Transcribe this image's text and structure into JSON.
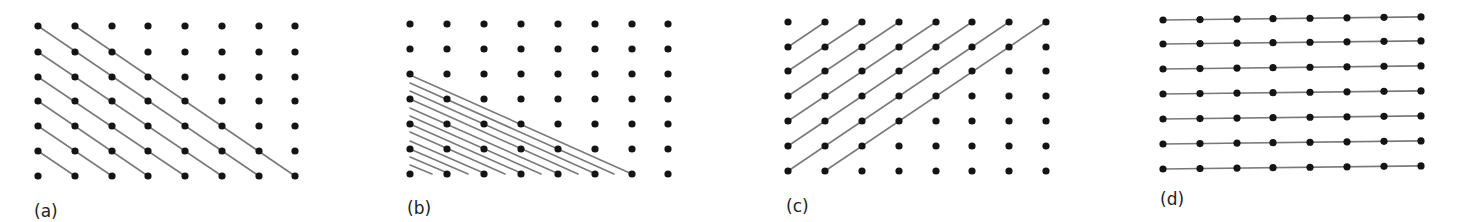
{
  "figure": {
    "colors": {
      "dot": "#141414",
      "line": "#7a7a7a",
      "label": "#222222",
      "background": "#ffffff"
    },
    "dot_radius": 3.6,
    "panels": [
      {
        "id": "a",
        "label": "(a)",
        "label_pos": [
          34,
          217
        ],
        "grid": {
          "cols": 8,
          "rows": 7,
          "x": [
            38,
            75,
            112,
            148,
            185,
            222,
            259,
            295
          ],
          "y": [
            26,
            52,
            77,
            101,
            126,
            151,
            176
          ]
        },
        "description": "Diagonal lines descending right, one column per row",
        "lines_grid": [
          [
            [
              1,
              0
            ],
            [
              7,
              6
            ]
          ],
          [
            [
              0,
              0
            ],
            [
              6,
              6
            ]
          ],
          [
            [
              0,
              1
            ],
            [
              5,
              6
            ]
          ],
          [
            [
              0,
              2
            ],
            [
              4,
              6
            ]
          ],
          [
            [
              0,
              3
            ],
            [
              3,
              6
            ]
          ],
          [
            [
              0,
              4
            ],
            [
              2,
              6
            ]
          ],
          [
            [
              0,
              5
            ],
            [
              1,
              6
            ]
          ]
        ]
      },
      {
        "id": "b",
        "label": "(b)",
        "label_pos": [
          407,
          214
        ],
        "grid": {
          "cols": 8,
          "rows": 7,
          "x": [
            410,
            447,
            484,
            521,
            558,
            595,
            632,
            668
          ],
          "y": [
            24,
            49,
            74,
            99,
            124,
            149,
            174
          ]
        },
        "description": "Dense family of shallow parallel lines in lower-left",
        "lines_px": [
          [
            [
              410,
              75
            ],
            [
              632,
              174
            ]
          ],
          [
            [
              410,
              83
            ],
            [
              614,
              174
            ]
          ],
          [
            [
              410,
              91
            ],
            [
              596,
              174
            ]
          ],
          [
            [
              410,
              99
            ],
            [
              578,
              174
            ]
          ],
          [
            [
              410,
              108
            ],
            [
              559,
              174
            ]
          ],
          [
            [
              410,
              116
            ],
            [
              541,
              174
            ]
          ],
          [
            [
              410,
              124
            ],
            [
              523,
              174
            ]
          ],
          [
            [
              410,
              132
            ],
            [
              505,
              174
            ]
          ],
          [
            [
              410,
              141
            ],
            [
              486,
              174
            ]
          ],
          [
            [
              410,
              149
            ],
            [
              468,
              174
            ]
          ],
          [
            [
              410,
              157
            ],
            [
              450,
              174
            ]
          ],
          [
            [
              410,
              165
            ],
            [
              432,
              174
            ]
          ]
        ]
      },
      {
        "id": "c",
        "label": "(c)",
        "label_pos": [
          786,
          212
        ],
        "grid": {
          "cols": 8,
          "rows": 7,
          "x": [
            788,
            825,
            862,
            899,
            936,
            972,
            1009,
            1046
          ],
          "y": [
            22,
            47,
            71,
            96,
            121,
            146,
            171
          ]
        },
        "description": "Diagonal lines ascending right, one column per row",
        "lines_grid": [
          [
            [
              0,
              1
            ],
            [
              1,
              0
            ]
          ],
          [
            [
              0,
              2
            ],
            [
              2,
              0
            ]
          ],
          [
            [
              0,
              3
            ],
            [
              3,
              0
            ]
          ],
          [
            [
              0,
              4
            ],
            [
              4,
              0
            ]
          ],
          [
            [
              0,
              5
            ],
            [
              5,
              0
            ]
          ],
          [
            [
              0,
              6
            ],
            [
              6,
              0
            ]
          ],
          [
            [
              1,
              6
            ],
            [
              7,
              0
            ]
          ]
        ]
      },
      {
        "id": "d",
        "label": "(d)",
        "label_pos": [
          1160,
          205
        ],
        "grid": {
          "cols": 8,
          "rows": 7,
          "x": [
            1163,
            1200,
            1237,
            1273,
            1310,
            1347,
            1384,
            1421
          ],
          "y": [
            20,
            44,
            69,
            94,
            119,
            144,
            169
          ],
          "tilt": -0.012
        },
        "description": "Horizontal lines connecting every row",
        "lines_grid": [
          [
            [
              0,
              0
            ],
            [
              7,
              0
            ]
          ],
          [
            [
              0,
              1
            ],
            [
              7,
              1
            ]
          ],
          [
            [
              0,
              2
            ],
            [
              7,
              2
            ]
          ],
          [
            [
              0,
              3
            ],
            [
              7,
              3
            ]
          ],
          [
            [
              0,
              4
            ],
            [
              7,
              4
            ]
          ],
          [
            [
              0,
              5
            ],
            [
              7,
              5
            ]
          ],
          [
            [
              0,
              6
            ],
            [
              7,
              6
            ]
          ]
        ]
      }
    ]
  }
}
